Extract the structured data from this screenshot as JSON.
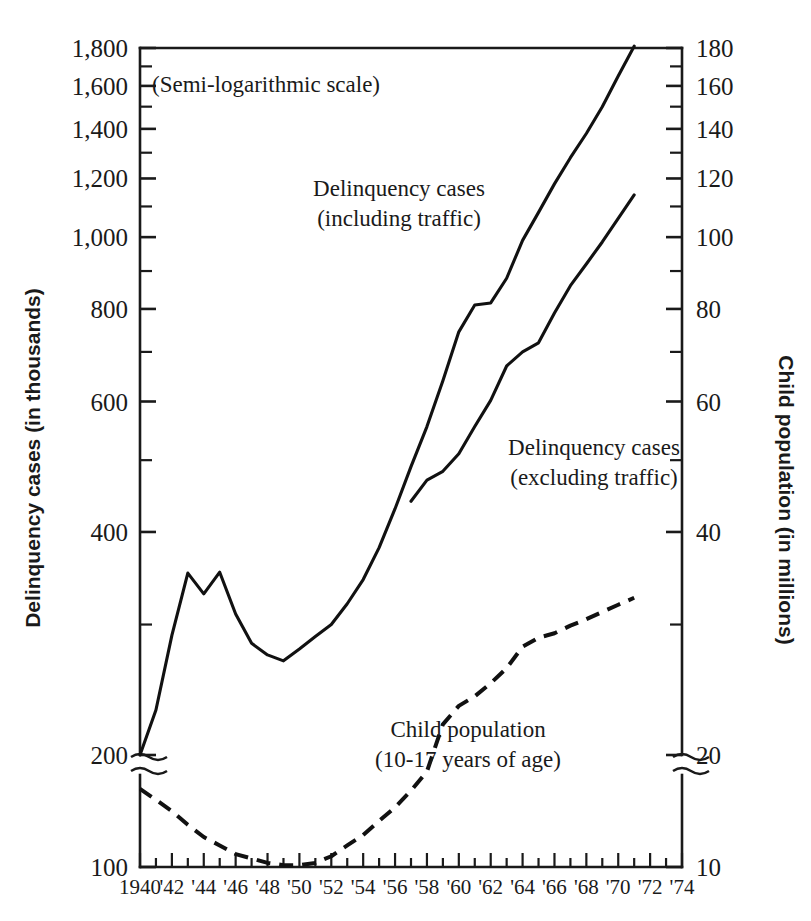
{
  "chart_data": {
    "type": "line",
    "title": "",
    "note": "(Semi-logarithmic scale)",
    "scale": "semi-logarithmic",
    "grid": false,
    "legend_position": "inline-annotations",
    "xlabel": "",
    "x_tick_labels": [
      "1940",
      "'42",
      "'44",
      "'46",
      "'48",
      "'50",
      "'52",
      "'54",
      "'56",
      "'58",
      "'60",
      "'62",
      "'64",
      "'66",
      "'68",
      "'70",
      "'72",
      "'74"
    ],
    "x_tick_years": [
      1940,
      1942,
      1944,
      1946,
      1948,
      1950,
      1952,
      1954,
      1956,
      1958,
      1960,
      1962,
      1964,
      1966,
      1968,
      1970,
      1972,
      1974
    ],
    "xlim": [
      1940,
      1974
    ],
    "left_axis": {
      "label": "Delinquency cases (in thousands)",
      "tick_labels": [
        "1,800",
        "1,600",
        "1,400",
        "1,200",
        "1,000",
        "800",
        "600",
        "400",
        "200",
        "100"
      ],
      "tick_values": [
        1800,
        1600,
        1400,
        1200,
        1000,
        800,
        600,
        400,
        200,
        100
      ],
      "minor_tick_values": [
        1700,
        1500,
        1300,
        1100,
        900,
        700,
        500,
        300
      ],
      "axis_break_between": [
        200,
        100
      ]
    },
    "right_axis": {
      "label": "Child population (in millions)",
      "tick_labels": [
        "180",
        "160",
        "140",
        "120",
        "100",
        "80",
        "60",
        "40",
        "20",
        "10"
      ],
      "tick_values": [
        180,
        160,
        140,
        120,
        100,
        80,
        60,
        40,
        20,
        10
      ],
      "minor_tick_values": [
        170,
        150,
        130,
        110,
        90,
        70,
        50,
        30
      ],
      "axis_break_between": [
        20,
        10
      ]
    },
    "annotations": [
      {
        "name": "delinquency-including-traffic-label",
        "lines": [
          "Delinquency cases",
          "(including traffic)"
        ],
        "x": 399,
        "y": 196
      },
      {
        "name": "delinquency-excluding-traffic-label",
        "lines": [
          "Delinquency cases",
          "(excluding traffic)"
        ],
        "x": 594,
        "y": 455
      },
      {
        "name": "child-population-label",
        "lines": [
          "Child population",
          "(10-17 years of age)"
        ],
        "x": 468,
        "y": 737
      }
    ],
    "series": [
      {
        "name": "Delinquency cases (including traffic)",
        "style": "solid",
        "axis": "left",
        "unit": "thousands",
        "x": [
          1940,
          1941,
          1942,
          1943,
          1944,
          1945,
          1946,
          1947,
          1948,
          1949,
          1950,
          1951,
          1952,
          1953,
          1954,
          1955,
          1956,
          1957,
          1958,
          1959,
          1960,
          1961,
          1962,
          1963,
          1964,
          1965,
          1966,
          1967,
          1968,
          1969,
          1970,
          1971
        ],
        "values": [
          200,
          230,
          290,
          352,
          330,
          353,
          310,
          283,
          273,
          268,
          278,
          289,
          300,
          320,
          345,
          381,
          430,
          490,
          555,
          640,
          745,
          810,
          815,
          880,
          990,
          1080,
          1180,
          1280,
          1380,
          1500,
          1650,
          1810
        ]
      },
      {
        "name": "Delinquency cases (excluding traffic)",
        "style": "solid",
        "axis": "left",
        "unit": "thousands",
        "x": [
          1957,
          1958,
          1959,
          1960,
          1961,
          1962,
          1963,
          1964,
          1965,
          1966,
          1967,
          1968,
          1969,
          1970,
          1971
        ],
        "values": [
          440,
          470,
          483,
          510,
          555,
          602,
          670,
          700,
          720,
          790,
          860,
          920,
          985,
          1060,
          1140
        ]
      },
      {
        "name": "Child population (10-17 years of age)",
        "style": "dashed",
        "axis": "right",
        "unit": "millions",
        "x": [
          1940,
          1941,
          1942,
          1943,
          1944,
          1945,
          1946,
          1947,
          1948,
          1949,
          1950,
          1951,
          1952,
          1953,
          1954,
          1955,
          1956,
          1957,
          1958,
          1959,
          1960,
          1961,
          1962,
          1963,
          1964,
          1965,
          1966,
          1967,
          1968,
          1969,
          1970,
          1971
        ],
        "values": [
          18.0,
          17.4,
          16.8,
          16.1,
          15.5,
          15.1,
          14.7,
          14.5,
          14.3,
          14.2,
          14.2,
          14.3,
          14.6,
          15.1,
          15.6,
          16.3,
          17.0,
          17.9,
          19.0,
          22.0,
          23.3,
          24.0,
          25.0,
          26.2,
          28.0,
          28.8,
          29.2,
          29.9,
          30.5,
          31.2,
          31.9,
          32.6
        ]
      }
    ]
  }
}
